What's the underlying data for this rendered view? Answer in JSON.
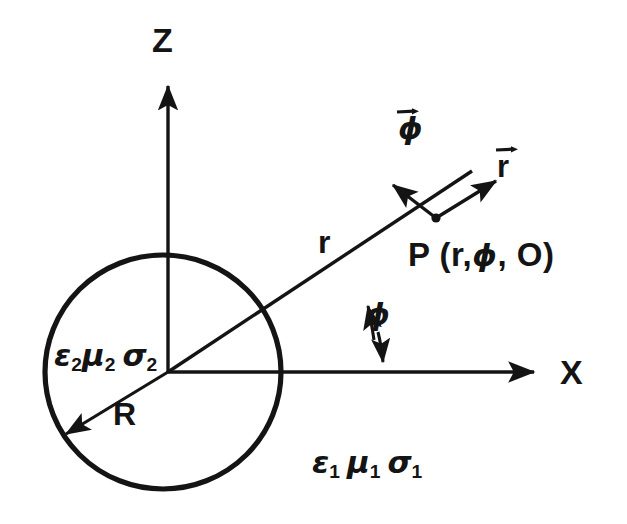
{
  "figure": {
    "background_color": "#ffffff",
    "ink_color": "#141414"
  },
  "axes": {
    "vertical": {
      "label": "Z",
      "direction": "up",
      "origin": [
        168,
        372
      ],
      "tip": [
        168,
        80
      ]
    },
    "horizontal": {
      "label": "X",
      "direction": "right",
      "origin": [
        168,
        372
      ],
      "tip": [
        542,
        372
      ]
    }
  },
  "sphere": {
    "center": [
      163,
      372
    ],
    "radius_px": 118,
    "radius_label": "R",
    "radius_arrow_angle_deg": 212
  },
  "media": {
    "outer": {
      "permittivity": "ε",
      "permittivity_sub": "1",
      "permeability": "μ",
      "permeability_sub": "1",
      "conductivity": "σ",
      "conductivity_sub": "1"
    },
    "inner": {
      "permittivity": "ε",
      "permittivity_sub": "2",
      "permeability": "μ",
      "permeability_sub": "2",
      "conductivity": "σ",
      "conductivity_sub": "2"
    }
  },
  "observation_point": {
    "marker_position": [
      435,
      218
    ],
    "label": "P (r,ϕ, O)",
    "label_prefix": "P (r,",
    "label_phi": "ϕ",
    "label_suffix": ", O)"
  },
  "radial_line": {
    "label": "r",
    "from": [
      168,
      372
    ],
    "to": [
      470,
      172
    ]
  },
  "unit_vectors": [
    {
      "name": "r-hat",
      "label": "r",
      "has_overarrow": true,
      "from": [
        435,
        218
      ],
      "to": [
        500,
        178
      ]
    },
    {
      "name": "phi-hat",
      "label": "ϕ",
      "has_overarrow": true,
      "from": [
        435,
        218
      ],
      "to": [
        389,
        182
      ]
    }
  ],
  "angle": {
    "label": "ϕ",
    "between": "radial line and X axis",
    "vertex": [
      168,
      372
    ]
  }
}
